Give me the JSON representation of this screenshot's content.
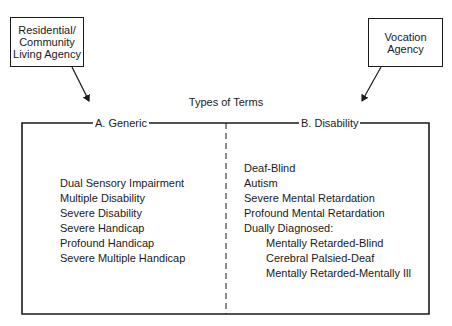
{
  "agencies": {
    "left": {
      "lines": [
        "Residential/",
        "Community",
        "Living Agency"
      ]
    },
    "right": {
      "lines": [
        "Vocation",
        "Agency"
      ]
    }
  },
  "title": "Types of Terms",
  "columns": {
    "generic": {
      "label": "A. Generic",
      "items": [
        "Dual Sensory Impairment",
        "Multiple Disability",
        "Severe Disability",
        "Severe Handicap",
        "Profound Handicap",
        "Severe Multiple Handicap"
      ]
    },
    "disability": {
      "label": "B. Disability",
      "items": [
        "Deaf-Blind",
        "Autism",
        "Severe Mental Retardation",
        "Profound Mental Retardation",
        "Dually Diagnosed:"
      ],
      "sub_items": [
        "Mentally Retarded-Blind",
        "Cerebral Palsied-Deaf",
        "Mentally Retarded-Mentally Ill"
      ]
    }
  },
  "colors": {
    "ink": "#1a1a1a",
    "background": "#ffffff"
  }
}
